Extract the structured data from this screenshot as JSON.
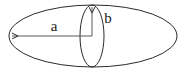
{
  "figure": {
    "background_color": "#ffffff",
    "stroke_color": "#2b2b2b",
    "label_color": "#1a1a1a",
    "width": 188,
    "height": 73
  },
  "shapes": {
    "outer_ellipse": {
      "name": "horizontal-ellipse",
      "center_x": 93,
      "center_y": 36,
      "radius_x": 84,
      "radius_y": 31
    },
    "inner_ellipse": {
      "name": "vertical-ellipse",
      "center_x": 92,
      "center_y": 36,
      "radius_x": 12,
      "radius_y": 31
    }
  },
  "arrows": {
    "semi_major": {
      "name": "semi-major-axis-arrow",
      "from_x": 92,
      "from_y": 36,
      "to_x": 11,
      "to_y": 36,
      "direction": "left",
      "label": "a"
    },
    "semi_minor": {
      "name": "semi-minor-axis-arrow",
      "from_x": 92,
      "from_y": 36,
      "to_x": 92,
      "to_y": 6,
      "direction": "up",
      "label": "b"
    }
  },
  "labels": {
    "a": {
      "text": "a",
      "x": 54,
      "y": 31
    },
    "b": {
      "text": "b",
      "x": 107,
      "y": 23
    }
  }
}
